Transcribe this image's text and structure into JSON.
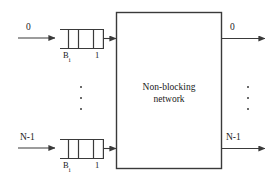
{
  "figure": {
    "type": "block-diagram",
    "background_color": "#ffffff",
    "line_color": "#3a3a3a",
    "text_color": "#1a1a1a"
  },
  "network_box": {
    "label_line1": "Non-blocking",
    "label_line2": "network",
    "label_full": "Non-blocking network"
  },
  "inputs": [
    {
      "port_label": "0",
      "buffer_label_base": "B",
      "buffer_label_subscript": "i",
      "buffer_cell_count_label": "1",
      "cells": 3
    },
    {
      "port_label": "N-1",
      "buffer_label_base": "B",
      "buffer_label_subscript": "i",
      "buffer_cell_count_label": "1",
      "cells": 3
    }
  ],
  "outputs": [
    {
      "port_label": "0"
    },
    {
      "port_label": "N-1"
    }
  ],
  "ellipsis": {
    "left_dots": 3,
    "right_dots": 3,
    "glyph": "vertical-dots"
  }
}
